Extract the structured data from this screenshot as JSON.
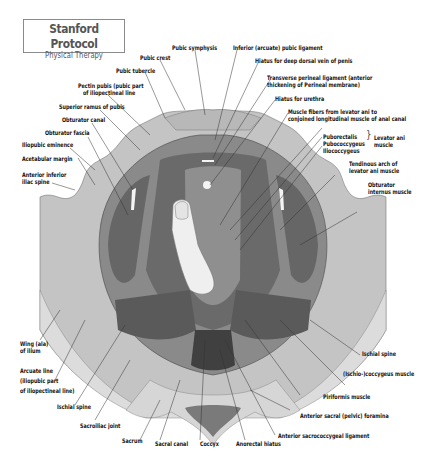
{
  "title": {
    "main": "Stanford Protocol",
    "sub": "Physical Therapy"
  },
  "labels": {
    "pubic_crest": "Pubic crest",
    "pubic_symphysis": "Pubic symphysis",
    "inferior_pubic_ligament": "Inferior (arcuate) pubic ligament",
    "hiatus_dorsal_vein": "Hiatus for deep dorsal vein of penis",
    "transverse_perineal_1": "Transverse perineal ligament (anterior",
    "transverse_perineal_2": "thickening of Perineal membrane)",
    "hiatus_urethra": "Hiatus for urethra",
    "muscle_fibers_1": "Muscle fibers from levator ani to",
    "muscle_fibers_2": "conjoined longitudinal muscle of anal canal",
    "puborectalis": "Puborectalis",
    "pubococcygeus": "Pubococcygeus",
    "iliococcygeus": "Iliococcygeus",
    "levator_ani_1": "Levator ani",
    "levator_ani_2": "muscle",
    "tendinous_arch_1": "Tendinous arch of",
    "tendinous_arch_2": "levator ani muscle",
    "obturator_internus_1": "Obturator",
    "obturator_internus_2": "internus muscle",
    "pubic_tubercle": "Pubic tubercle",
    "pecten_pubis_1": "Pectin pubis (pubic part",
    "pecten_pubis_2": "of iliopectineal line",
    "superior_ramus": "Superior ramus of pubis",
    "obturator_canal": "Obturator canal",
    "obturator_fascia": "Obturator fascia",
    "iliopubic_eminence": "Iliopubic eminence",
    "acetabular_margin": "Acetabular margin",
    "anterior_inferior_iliac_1": "Anterior inferior",
    "anterior_inferior_iliac_2": "iliac spine",
    "wing_ilium_1": "Wing (ala)",
    "wing_ilium_2": "of ilium",
    "arcuate_line_1": "Arcuate line",
    "arcuate_line_2": "(iliopubic part",
    "arcuate_line_3": "of iliopectineal line)",
    "ischial_spine_left": "Ischial spine",
    "sacroiliac_joint": "Sacroiliac joint",
    "sacrum": "Sacrum",
    "sacral_canal": "Sacral canal",
    "coccyx": "Coccyx",
    "anorectal_hiatus": "Anorectal hiatus",
    "anterior_sacrococcygeal": "Anterior sacrococcygeal ligament",
    "anterior_sacral_foramina": "Anterior sacral (pelvic) foramina",
    "piriformis": "Piriformis muscle",
    "ischiococcygeus": "(Ischio-)coccygeus muscle",
    "ischial_spine_right": "Ischial spine"
  },
  "colors": {
    "bone_light": "#d9d9d9",
    "bone": "#bdbdbd",
    "muscle_mid": "#8c8c8c",
    "muscle_dark": "#5e5e5e",
    "muscle_darker": "#4a4a4a",
    "finger": "#efefef"
  }
}
